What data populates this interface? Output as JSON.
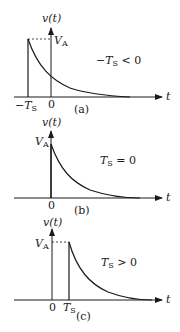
{
  "panels": [
    {
      "id": "a",
      "caption": "(a)",
      "y_label": "v(t)",
      "x_label": "t",
      "peak_label": "V",
      "peak_sub": "A",
      "tick_labels": [
        "−T",
        "0"
      ],
      "tick_sub": "S",
      "condition_prefix": "−T",
      "condition_sub": "S",
      "condition_suffix": " < 0"
    },
    {
      "id": "b",
      "caption": "(b)",
      "y_label": "v(t)",
      "x_label": "t",
      "peak_label": "V",
      "peak_sub": "A",
      "tick_labels": [
        "0"
      ],
      "condition_prefix": "T",
      "condition_sub": "S",
      "condition_suffix": " = 0"
    },
    {
      "id": "c",
      "caption": "(c)",
      "y_label": "v(t)",
      "x_label": "t",
      "peak_label": "V",
      "peak_sub": "A",
      "tick_labels": [
        "0",
        "T"
      ],
      "tick_sub": "S",
      "condition_prefix": "T",
      "condition_sub": "S",
      "condition_suffix": " > 0"
    }
  ]
}
